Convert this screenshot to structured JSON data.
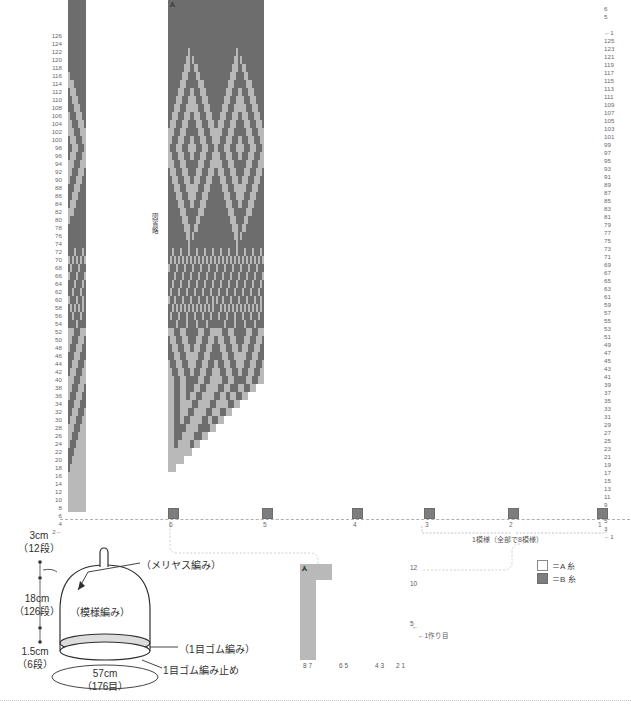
{
  "meta": {
    "colors": {
      "yarnA": "#ffffff",
      "yarnB": "#7d7d7d",
      "grid": "#b9b9b9",
      "text": "#3a3a3a"
    }
  },
  "chart": {
    "left_rail_label": "図省略",
    "left_row_numbers": [
      "126",
      "124",
      "122",
      "120",
      "118",
      "116",
      "114",
      "112",
      "110",
      "108",
      "106",
      "104",
      "102",
      "100",
      "98",
      "96",
      "94",
      "92",
      "90",
      "88",
      "86",
      "84",
      "82",
      "80",
      "78",
      "76",
      "74",
      "72",
      "70",
      "68",
      "66",
      "64",
      "62",
      "60",
      "58",
      "56",
      "54",
      "52",
      "50",
      "48",
      "46",
      "44",
      "42",
      "40",
      "38",
      "36",
      "34",
      "32",
      "30",
      "28",
      "26",
      "24",
      "22",
      "20",
      "18",
      "16",
      "14",
      "12",
      "10",
      "8",
      "6",
      "4",
      "2←"
    ],
    "right_top_numbers": [
      "6",
      "5"
    ],
    "right_row_numbers": [
      "←1",
      "125",
      "123",
      "121",
      "119",
      "117",
      "115",
      "113",
      "111",
      "109",
      "107",
      "105",
      "103",
      "101",
      "99",
      "97",
      "95",
      "93",
      "91",
      "89",
      "87",
      "85",
      "83",
      "81",
      "79",
      "77",
      "75",
      "73",
      "71",
      "69",
      "67",
      "65",
      "63",
      "61",
      "59",
      "57",
      "55",
      "53",
      "51",
      "49",
      "47",
      "45",
      "43",
      "41",
      "39",
      "37",
      "35",
      "33",
      "31",
      "29",
      "27",
      "25",
      "23",
      "21",
      "19",
      "17",
      "15",
      "13",
      "11",
      "9",
      "7",
      "5",
      "3",
      "←1"
    ],
    "column_markers": [
      "6",
      "5",
      "4",
      "3",
      "2",
      "1"
    ],
    "repeat_label": "1模様（全部で8模様）"
  },
  "legend": {
    "items": [
      {
        "swatch": "white-square",
        "label": "＝A 糸"
      },
      {
        "swatch": "gray-square",
        "label": "＝B 糸"
      }
    ]
  },
  "detail_chart": {
    "row_labels": [
      "12",
      "10",
      "5"
    ],
    "cast_on_label": "←1作り目",
    "arrow_label": "←",
    "column_groups": [
      "8 7",
      "6 5",
      "4 3",
      "2 1"
    ]
  },
  "schematic": {
    "dim_top": {
      "cm": "3cm",
      "rows": "（12段）"
    },
    "dim_mid": {
      "cm": "18cm",
      "rows": "（126段）"
    },
    "dim_bottom": {
      "cm": "1.5cm",
      "rows": "（6段）"
    },
    "width": {
      "cm": "57cm",
      "stitches": "（176目）"
    },
    "callout_top": "（メリヤス編み）",
    "callout_body": "（模様編み）",
    "callout_rib": "（1目ゴム編み）",
    "callout_bindoff": "1目ゴム編み止め"
  }
}
